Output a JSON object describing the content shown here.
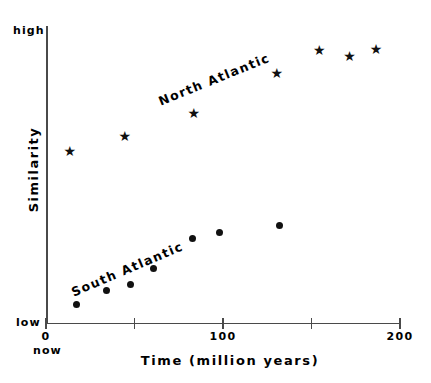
{
  "chart_data": {
    "type": "scatter",
    "title": "",
    "xlabel": "Time  (million years)",
    "ylabel": "Similarity",
    "xlim": [
      0,
      200
    ],
    "ylim": [
      0,
      1
    ],
    "grid": false,
    "legend_position": "inline-annotations",
    "x_ticks": [
      {
        "value": 0,
        "label": "0"
      },
      {
        "value": 50,
        "label": ""
      },
      {
        "value": 100,
        "label": "100"
      },
      {
        "value": 150,
        "label": ""
      },
      {
        "value": 200,
        "label": "200"
      }
    ],
    "y_axis_end_labels": {
      "high": "high",
      "low": "low"
    },
    "x_axis_origin_note": "now",
    "series": [
      {
        "name": "North Atlantic",
        "marker": "star",
        "color": "#111111",
        "points": [
          {
            "x": 13,
            "y": 0.585
          },
          {
            "x": 44,
            "y": 0.635
          },
          {
            "x": 83,
            "y": 0.712
          },
          {
            "x": 130,
            "y": 0.847
          },
          {
            "x": 154,
            "y": 0.928
          },
          {
            "x": 171,
            "y": 0.908
          },
          {
            "x": 186,
            "y": 0.931
          }
        ]
      },
      {
        "name": "South Atlantic",
        "marker": "dot",
        "color": "#111111",
        "points": [
          {
            "x": 17,
            "y": 0.064
          },
          {
            "x": 34,
            "y": 0.111
          },
          {
            "x": 48,
            "y": 0.131
          },
          {
            "x": 61,
            "y": 0.185
          },
          {
            "x": 83,
            "y": 0.289
          },
          {
            "x": 98,
            "y": 0.309
          },
          {
            "x": 132,
            "y": 0.332
          }
        ]
      }
    ]
  },
  "annotations": {
    "north_atlantic": "North Atlantic",
    "south_atlantic": "South Atlantic"
  }
}
